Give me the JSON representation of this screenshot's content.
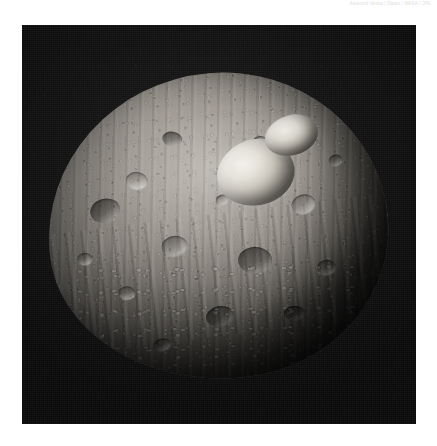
{
  "header": {
    "caption": "Asteroid Vesta | Dawn | NASA / JPL"
  },
  "figure": {
    "alt": "Grayscale spacecraft photograph of asteroid 4 Vesta against black space",
    "background_color": "#0a0a0a",
    "features": {
      "snowman_craters_label": "snowman-craters",
      "terminator_label": "terminator",
      "limb_label": "limb",
      "regolith_label": "cratered-regolith"
    }
  },
  "page": {
    "background_color": "#ffffff",
    "width": 437,
    "height": 446
  }
}
